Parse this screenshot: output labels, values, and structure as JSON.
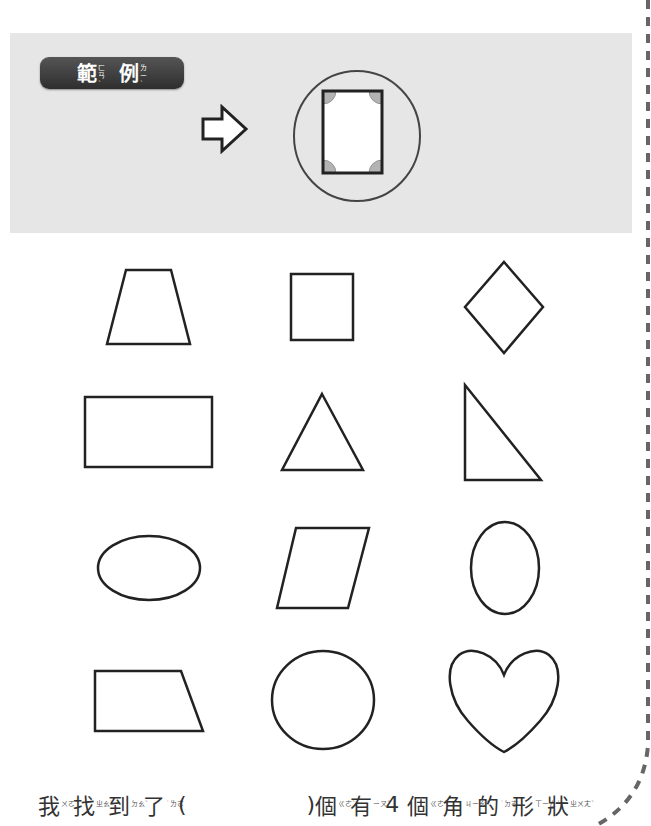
{
  "example": {
    "badge": [
      {
        "char": "範",
        "zhuyin": "ㄈㄢˋ"
      },
      {
        "char": "例",
        "zhuyin": "ㄌㄧˋ"
      }
    ],
    "arrow_icon": "right-arrow-icon",
    "highlight_color": "#b3b3b3"
  },
  "shapes": [
    {
      "name": "trapezoid",
      "row": 1,
      "col": 1
    },
    {
      "name": "square",
      "row": 1,
      "col": 2
    },
    {
      "name": "rhombus",
      "row": 1,
      "col": 3
    },
    {
      "name": "rectangle",
      "row": 2,
      "col": 1
    },
    {
      "name": "triangle",
      "row": 2,
      "col": 2
    },
    {
      "name": "right-triangle",
      "row": 2,
      "col": 3
    },
    {
      "name": "horizontal-ellipse",
      "row": 3,
      "col": 1
    },
    {
      "name": "parallelogram",
      "row": 3,
      "col": 2
    },
    {
      "name": "vertical-ellipse",
      "row": 3,
      "col": 3
    },
    {
      "name": "right-trapezoid",
      "row": 4,
      "col": 1
    },
    {
      "name": "circle",
      "row": 4,
      "col": 2
    },
    {
      "name": "heart",
      "row": 4,
      "col": 3
    }
  ],
  "sentence": {
    "part1": [
      {
        "char": "我",
        "zhuyin": "ㄨㄛˇ"
      },
      {
        "char": "找",
        "zhuyin": "ㄓㄠˇ"
      },
      {
        "char": "到",
        "zhuyin": "ㄉㄠˋ"
      },
      {
        "char": "了",
        "zhuyin": "˙ㄌㄜ"
      }
    ],
    "open_paren": "(",
    "answer": "",
    "close_paren": ")",
    "part2": [
      {
        "char": "個",
        "zhuyin": "ㄍㄜˋ"
      },
      {
        "char": "有",
        "zhuyin": "ㄧㄡˇ"
      }
    ],
    "number": "4",
    "part3": [
      {
        "char": "個",
        "zhuyin": "ㄍㄜˋ"
      },
      {
        "char": "角",
        "zhuyin": "ㄐㄧㄠˇ"
      },
      {
        "char": "的",
        "zhuyin": "˙ㄉㄜ"
      },
      {
        "char": "形",
        "zhuyin": "ㄒㄧㄥˊ"
      },
      {
        "char": "狀",
        "zhuyin": "ㄓㄨㄤˋ"
      }
    ]
  }
}
